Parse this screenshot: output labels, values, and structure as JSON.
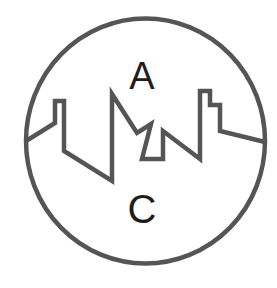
{
  "logo": {
    "top_letter": "A",
    "bottom_letter": "C",
    "colors": {
      "outline": "#555555",
      "letters": "#1e1e1e",
      "background": "#ffffff"
    },
    "icon": "circle-skyline-emblem"
  }
}
